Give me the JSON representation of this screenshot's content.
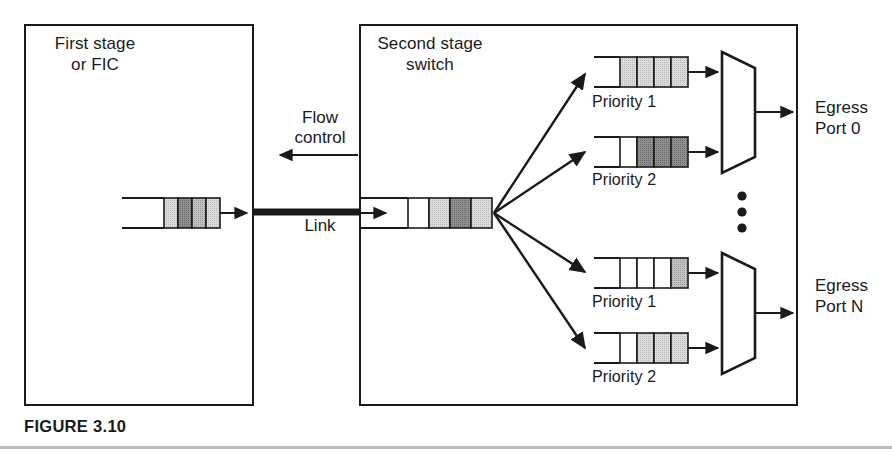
{
  "figure": {
    "caption": "FIGURE 3.10",
    "colors": {
      "stroke": "#1a1a1a",
      "cell_empty": "#ffffff",
      "cell_light": "#d0d0d0",
      "cell_medium": "#b0b0b0",
      "cell_dark": "#808080",
      "caption_rule": "#bdbdbd"
    }
  },
  "first_stage": {
    "label": "First stage\nor FIC",
    "queue": {
      "name": "first-stage-queue",
      "cell_count": 4,
      "cells": [
        "light",
        "dark",
        "medium",
        "light"
      ]
    }
  },
  "link": {
    "flow_control_label": "Flow\ncontrol",
    "link_label": "Link",
    "flow_control_direction": "left",
    "link_direction": "right"
  },
  "second_stage": {
    "label": "Second stage\nswitch",
    "input_queue": {
      "name": "second-stage-input-queue",
      "cell_count": 4,
      "cells": [
        "empty",
        "light",
        "dark",
        "light"
      ]
    },
    "fanout_arrow_count": 4,
    "ellipsis": "⋮",
    "port_groups": [
      {
        "egress_label": "Egress\nPort 0",
        "queues": [
          {
            "label": "Priority 1",
            "cell_count": 4,
            "cells": [
              "light",
              "light",
              "light",
              "light"
            ]
          },
          {
            "label": "Priority 2",
            "cell_count": 4,
            "cells": [
              "empty",
              "dark",
              "dark",
              "dark"
            ]
          }
        ]
      },
      {
        "egress_label": "Egress\nPort N",
        "queues": [
          {
            "label": "Priority 1",
            "cell_count": 4,
            "cells": [
              "empty",
              "empty",
              "empty",
              "medium"
            ]
          },
          {
            "label": "Priority 2",
            "cell_count": 4,
            "cells": [
              "empty",
              "light",
              "light",
              "light"
            ]
          }
        ]
      }
    ]
  }
}
